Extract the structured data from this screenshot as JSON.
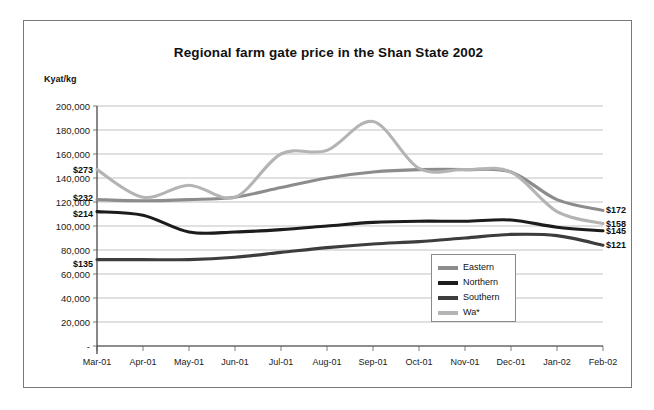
{
  "figure": {
    "title": "Regional farm gate price in the Shan State  2002",
    "y_axis_title": "Kyat/kg"
  },
  "legend": {
    "items": [
      {
        "label": "Eastern",
        "color": "#8c8c8c"
      },
      {
        "label": "Northern",
        "color": "#1c1c1c"
      },
      {
        "label": "Southern",
        "color": "#3d3d3d"
      },
      {
        "label": "Wa*",
        "color": "#b4b4b4"
      }
    ]
  },
  "annotations": {
    "left": [
      {
        "text": "$273",
        "value": 147000
      },
      {
        "text": "$232",
        "value": 123000
      },
      {
        "text": "$214",
        "value": 110000
      },
      {
        "text": "$135",
        "value": 68000
      }
    ],
    "right": [
      {
        "text": "$172",
        "value": 113000
      },
      {
        "text": "$158",
        "value": 102000
      },
      {
        "text": "$145",
        "value": 96000
      },
      {
        "text": "$121",
        "value": 84000
      }
    ]
  },
  "chart_data": {
    "type": "line",
    "title": "Regional farm gate price in the Shan State  2002",
    "xlabel": "",
    "ylabel": "Kyat/kg",
    "ylim": [
      0,
      200000
    ],
    "ytick_labels": [
      "200,000",
      "180,000",
      "160,000",
      "140,000",
      "120,000",
      "100,000",
      "80,000",
      "60,000",
      "40,000",
      "20,000",
      "-"
    ],
    "ytick_values": [
      200000,
      180000,
      160000,
      140000,
      120000,
      100000,
      80000,
      60000,
      40000,
      20000,
      0
    ],
    "grid": true,
    "legend_position": "inside-bottom-right",
    "categories": [
      "Mar-01",
      "Apr-01",
      "May-01",
      "Jun-01",
      "Jul-01",
      "Aug-01",
      "Sep-01",
      "Oct-01",
      "Nov-01",
      "Dec-01",
      "Jan-02",
      "Feb-02"
    ],
    "series": [
      {
        "name": "Eastern",
        "color": "#8c8c8c",
        "values": [
          122000,
          121000,
          122000,
          124000,
          132000,
          140000,
          145000,
          147000,
          147000,
          145000,
          122000,
          113000
        ]
      },
      {
        "name": "Northern",
        "color": "#1c1c1c",
        "values": [
          112000,
          109000,
          95000,
          95000,
          97000,
          100000,
          103000,
          104000,
          104000,
          105000,
          99000,
          96000
        ]
      },
      {
        "name": "Southern",
        "color": "#3d3d3d",
        "values": [
          72000,
          72000,
          72000,
          74000,
          78000,
          82000,
          85000,
          87000,
          90000,
          93000,
          92000,
          84000
        ]
      },
      {
        "name": "Wa*",
        "color": "#b4b4b4",
        "values": [
          147000,
          124000,
          134000,
          124000,
          160000,
          163000,
          187000,
          148000,
          147000,
          145000,
          112000,
          102000
        ]
      }
    ]
  }
}
